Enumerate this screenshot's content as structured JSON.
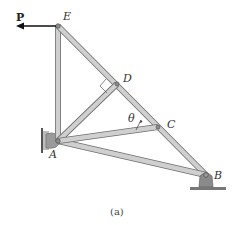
{
  "figure": {
    "caption": "(a)",
    "load_label": "P",
    "angle_label": "θ",
    "joints": {
      "A": {
        "label": "A",
        "x": 58,
        "y": 141
      },
      "B": {
        "label": "B",
        "x": 206,
        "y": 175
      },
      "C": {
        "label": "C",
        "x": 158,
        "y": 127
      },
      "D": {
        "label": "D",
        "x": 117,
        "y": 84
      },
      "E": {
        "label": "E",
        "x": 58,
        "y": 26
      }
    },
    "members": [
      "EA",
      "EB",
      "AD",
      "AC",
      "AB"
    ],
    "colors": {
      "member_fill": "#c9c9c9",
      "member_edge": "#6e6e6e",
      "support": "#8a8a8a",
      "arrow": "#111111"
    }
  }
}
